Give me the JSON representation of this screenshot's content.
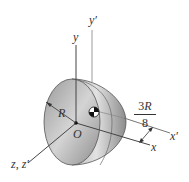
{
  "figure": {
    "type": "hemisphere-centroid-diagram",
    "colors": {
      "axis": "#444444",
      "axis_light": "#9a9a9a",
      "solid_dark": "#8a8a8a",
      "solid_light": "#d6d6d6",
      "text": "#333333"
    },
    "labels": {
      "y": "y",
      "y_prime": "y′",
      "x": "x",
      "x_prime": "x′",
      "z": "z, z′",
      "origin": "O",
      "radius": "R",
      "offset_numerator_coef": "3",
      "offset_numerator_var": "R",
      "offset_denominator": "8"
    },
    "annotations": {
      "center_of_mass_symbol": "centroid-marker",
      "offset_dimension": "3R/8"
    }
  }
}
